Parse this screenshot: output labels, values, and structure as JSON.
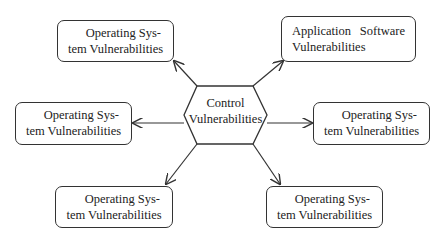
{
  "diagram": {
    "center": {
      "line1": "Control",
      "line2": "Vulnerabilities",
      "shape": "hexagon"
    },
    "nodes": [
      {
        "id": "top-left",
        "line1": "Operating Sys-",
        "line2": "tem Vulnerabilities"
      },
      {
        "id": "top-right",
        "line1": "Application Software",
        "line2": "Vulnerabilities"
      },
      {
        "id": "middle-left",
        "line1": "Operating Sys-",
        "line2": "tem Vulnerabilities"
      },
      {
        "id": "middle-right",
        "line1": "Operating Sys-",
        "line2": "tem Vulnerabilities"
      },
      {
        "id": "bottom-left",
        "line1": "Operating Sys-",
        "line2": "tem Vulnerabilities"
      },
      {
        "id": "bottom-right",
        "line1": "Operating Sys-",
        "line2": "tem Vulnerabilities"
      }
    ],
    "edges": [
      {
        "from": "center",
        "to": "top-left",
        "arrow": "to"
      },
      {
        "from": "center",
        "to": "top-right",
        "arrow": "to"
      },
      {
        "from": "center",
        "to": "middle-left",
        "arrow": "to"
      },
      {
        "from": "center",
        "to": "middle-right",
        "arrow": "to"
      },
      {
        "from": "center",
        "to": "bottom-left",
        "arrow": "to"
      },
      {
        "from": "center",
        "to": "bottom-right",
        "arrow": "to"
      }
    ],
    "colors": {
      "stroke": "#333333",
      "background": "#ffffff",
      "text": "#222222"
    }
  }
}
